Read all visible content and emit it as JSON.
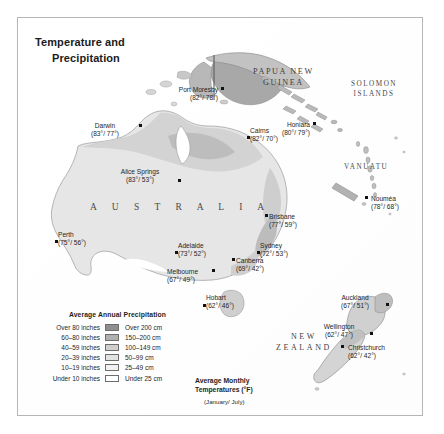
{
  "title": {
    "line1": "Temperature and",
    "line2": "Precipitation"
  },
  "regions": {
    "australia": "A U S T R A L I A",
    "papua_new_guinea_line1": "PAPUA NEW",
    "papua_new_guinea_line2": "GUINEA",
    "solomon_line1": "SOLOMON",
    "solomon_line2": "ISLANDS",
    "vanuatu": "VANUATU",
    "new_caledonia": "New Caledonia",
    "new_caledonia_sovereign": "Fr.",
    "new_zealand_line1": "NEW",
    "new_zealand_line2": "ZEALAND",
    "tasmania": "Tasmania"
  },
  "cities": [
    {
      "name": "Darwin",
      "temps": "(83°/ 77°)"
    },
    {
      "name": "Alice Springs",
      "temps": "(83°/ 53°)"
    },
    {
      "name": "Perth",
      "temps": "(75°/ 56°)"
    },
    {
      "name": "Adelaide",
      "temps": "(73°/ 52°)"
    },
    {
      "name": "Melbourne",
      "temps": "(67°/ 49°)"
    },
    {
      "name": "Hobart",
      "temps": "(62°/ 46°)"
    },
    {
      "name": "Canberra",
      "temps": "(69°/ 42°)"
    },
    {
      "name": "Sydney",
      "temps": "(72°/ 53°)"
    },
    {
      "name": "Brisbane",
      "temps": "(77°/ 59°)"
    },
    {
      "name": "Cairns",
      "temps": "(82°/ 70°)"
    },
    {
      "name": "Port Moresby",
      "temps": "(82°/ 78°)"
    },
    {
      "name": "Honiara",
      "temps": "(80°/ 79°)"
    },
    {
      "name": "Nouméa",
      "temps": "(78°/ 68°)"
    },
    {
      "name": "Auckland",
      "temps": "(67°/ 51°)"
    },
    {
      "name": "Wellington",
      "temps": "(62°/ 47°)"
    },
    {
      "name": "Christchurch",
      "temps": "(62°/ 42°)"
    }
  ],
  "legend_precipitation": {
    "title": "Average Annual Precipitation",
    "rows": [
      {
        "inches": "Over 80 inches",
        "cm": "Over 200 cm",
        "color": "#8e8e8e"
      },
      {
        "inches": "60–80 inches",
        "cm": "150–200 cm",
        "color": "#b0b0b0"
      },
      {
        "inches": "40–59 inches",
        "cm": "100–149 cm",
        "color": "#cfcfcf"
      },
      {
        "inches": "20–39 inches",
        "cm": "50–99 cm",
        "color": "#e2e2e2"
      },
      {
        "inches": "10–19 inches",
        "cm": "25–49 cm",
        "color": "#f2f2f2"
      },
      {
        "inches": "Under 10 inches",
        "cm": "Under 25 cm",
        "color": "#ffffff"
      }
    ]
  },
  "legend_temperature": {
    "line1": "Average Monthly",
    "line2": "Temperatures (°F)",
    "note": "(January/ July)"
  },
  "colors": {
    "frame_border": "#b5b5b5",
    "background": "#ffffff",
    "land_light": "#ececec",
    "land_mid": "#d6d6d6",
    "land_dark": "#b4b4b4",
    "coast_line": "#9a9a9a",
    "text": "#1f1f1f"
  }
}
